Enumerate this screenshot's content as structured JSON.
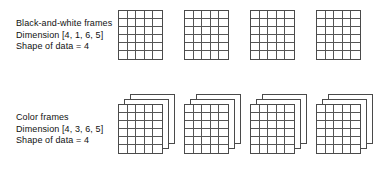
{
  "figure": {
    "background_color": "#ffffff",
    "stroke_color": "#4a4a4a",
    "grid_line_color": "#555555"
  },
  "rows": [
    {
      "id": "black-and-white",
      "caption": {
        "line1": "Black-and-white frames",
        "line2": "Dimension [4, 1, 6, 5]",
        "line3": "Shape of data = 4"
      },
      "frame_count": 4,
      "layers_per_frame": 1,
      "grid_columns": 5,
      "grid_rows": 6,
      "frame_width": 45,
      "frame_height": 50,
      "frame_spacing": 66,
      "first_frame_left": 118,
      "frame_top": 10
    },
    {
      "id": "color",
      "caption": {
        "line1": "Color frames",
        "line2": "Dimension [4, 3, 6, 5]",
        "line3": "Shape of data = 4"
      },
      "frame_count": 4,
      "layers_per_frame": 3,
      "grid_columns": 5,
      "grid_rows": 6,
      "frame_width": 45,
      "frame_height": 50,
      "frame_spacing": 66,
      "first_frame_left": 118,
      "frame_top": 8
    }
  ]
}
